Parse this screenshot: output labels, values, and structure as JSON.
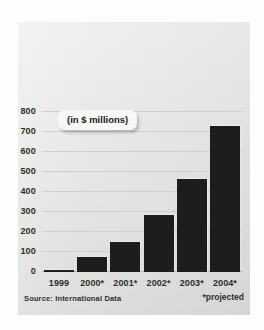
{
  "chart_data": {
    "type": "bar",
    "title": "",
    "subtitle": "",
    "annotation": "(in $ millions)",
    "categories": [
      "1999",
      "2000*",
      "2001*",
      "2002*",
      "2003*",
      "2004*"
    ],
    "values": [
      10,
      75,
      150,
      285,
      465,
      730
    ],
    "xlabel": "",
    "ylabel": "",
    "ylim": [
      0,
      800
    ],
    "yticks": [
      800,
      700,
      600,
      500,
      400,
      300,
      200,
      100,
      0
    ],
    "ytick_labels": [
      "800",
      "700",
      "600",
      "500",
      "400",
      "300",
      "200",
      "100",
      "0"
    ],
    "grid": true,
    "legend": "none",
    "bar_color": "#1d1d1d",
    "panel_color": "#e9e9e7",
    "gridline_color": "#cfcfcb",
    "text_color": "#2e2e2e",
    "source": "Source: International Data",
    "footnote": "*projected"
  }
}
